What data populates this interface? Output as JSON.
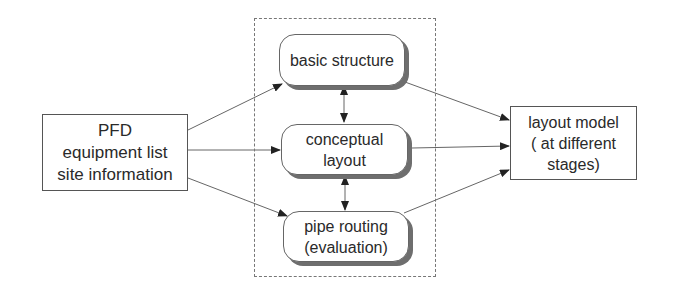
{
  "diagram": {
    "type": "flow",
    "inputs_box": {
      "lines": [
        "PFD",
        "equipment list",
        "site information"
      ]
    },
    "process_group": {
      "style": "dashed-frame",
      "steps": [
        {
          "id": "basic",
          "label": "basic structure"
        },
        {
          "id": "conceptual",
          "label": "conceptual\nlayout"
        },
        {
          "id": "pipe",
          "label": "pipe routing\n(evaluation)"
        }
      ]
    },
    "output_box": {
      "lines": [
        "layout model",
        "( at different",
        "stages)"
      ]
    },
    "edges": [
      {
        "from": "inputs",
        "to": "basic",
        "arrow": "single"
      },
      {
        "from": "inputs",
        "to": "conceptual",
        "arrow": "single"
      },
      {
        "from": "inputs",
        "to": "pipe",
        "arrow": "single"
      },
      {
        "from": "basic",
        "to": "conceptual",
        "arrow": "double"
      },
      {
        "from": "conceptual",
        "to": "pipe",
        "arrow": "double"
      },
      {
        "from": "basic",
        "to": "output",
        "arrow": "single"
      },
      {
        "from": "conceptual",
        "to": "output",
        "arrow": "single"
      },
      {
        "from": "pipe",
        "to": "output",
        "arrow": "single"
      }
    ],
    "colors": {
      "line": "#555555",
      "shadow": "#6e6e6e",
      "frame": "#777777"
    }
  }
}
